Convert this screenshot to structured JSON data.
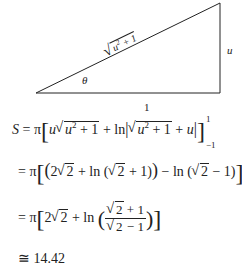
{
  "figure": {
    "hypotenuse_label": "√(u² + 1)",
    "opposite_label": "u",
    "adjacent_label": "1",
    "angle_label": "θ"
  },
  "equations": {
    "line1": "S = π[ u√(u² + 1) + ln|√(u² + 1) + u| ] from −1 to 1",
    "line1_lhs": "S",
    "line1_upper": "1",
    "line1_lower": "−1",
    "line2": "= π[ (2√2 + ln(√2 + 1)) − ln(√2 − 1) ]",
    "line3": "= π[ 2√2 + ln( (√2 + 1)/(√2 − 1) ) ]",
    "line4": "≅ 14.42",
    "result": "14.42"
  }
}
